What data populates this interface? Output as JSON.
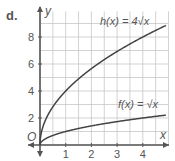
{
  "part_label": "d.",
  "chart_data": {
    "type": "line",
    "title": "",
    "xlabel": "x",
    "ylabel": "y",
    "origin_label": "O",
    "xlim": [
      0,
      5
    ],
    "ylim": [
      0,
      9.5
    ],
    "x_ticks": [
      1,
      2,
      3,
      4
    ],
    "y_ticks": [
      2,
      4,
      6,
      8
    ],
    "grid": true,
    "grid_step_x": 0.5,
    "grid_step_y": 1,
    "series": [
      {
        "name": "h(x) = 4√x",
        "label_text": "h(x) = 4√x",
        "formula": "4*sqrt(x)",
        "x": [
          0,
          0.25,
          0.5,
          1,
          2,
          3,
          4,
          4.9
        ],
        "values": [
          0,
          2,
          2.83,
          4,
          5.66,
          6.93,
          8,
          8.85
        ]
      },
      {
        "name": "f(x) = √x",
        "label_text": "f(x) = √x",
        "formula": "sqrt(x)",
        "x": [
          0,
          0.25,
          0.5,
          1,
          2,
          3,
          4,
          4.9
        ],
        "values": [
          0,
          0.5,
          0.71,
          1,
          1.41,
          1.73,
          2,
          2.21
        ]
      }
    ]
  },
  "colors": {
    "grid": "#c8c8c8",
    "axis": "#555555",
    "curve": "#444444",
    "text": "#555555"
  }
}
